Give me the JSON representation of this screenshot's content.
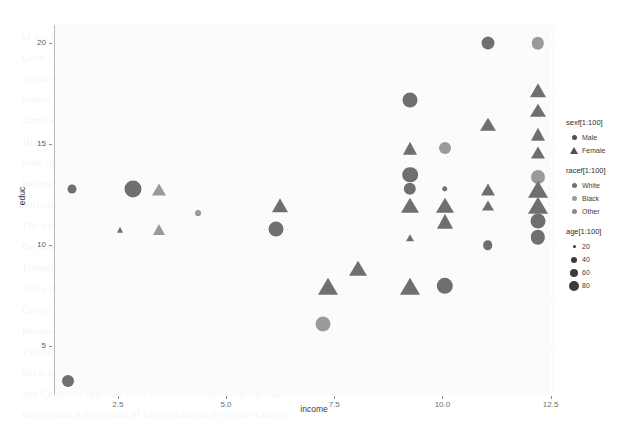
{
  "chart_data": {
    "type": "scatter",
    "title": "",
    "xlabel": "income",
    "ylabel": "educ",
    "xlim": [
      1.05,
      12.6
    ],
    "ylim": [
      2.6,
      20.9
    ],
    "xticks": [
      "2.5",
      "5.0",
      "7.5",
      "10.0",
      "12.5"
    ],
    "xtick_values": [
      2.5,
      5.0,
      7.5,
      10.0,
      12.5
    ],
    "yticks": [
      "5",
      "10",
      "15",
      "20"
    ],
    "ytick_values": [
      5,
      10,
      15,
      20
    ],
    "grid": true,
    "grid_color": "#ffffff",
    "panel_background": "#fbfbfb",
    "legend_position": "right",
    "encodings": {
      "shape": "sexf[1:100]",
      "color": "racef[1:100]",
      "size": "age[1:100]"
    },
    "shape_map": {
      "Male": "circle",
      "Female": "triangle"
    },
    "color_map": {
      "White": "#6f6f6f",
      "Black": "#9a9a9a",
      "Other": "#8a8a8a"
    },
    "size_map": {
      "20": 3,
      "40": 6,
      "60": 8,
      "80": 10
    },
    "points": [
      {
        "income": 1.35,
        "educ": 3.3,
        "sex": "Male",
        "race": "White",
        "age": 40
      },
      {
        "income": 1.45,
        "educ": 12.8,
        "sex": "Male",
        "race": "White",
        "age": 30
      },
      {
        "income": 2.85,
        "educ": 12.8,
        "sex": "Male",
        "race": "White",
        "age": 65
      },
      {
        "income": 2.55,
        "educ": 10.8,
        "sex": "Female",
        "race": "White",
        "age": 22
      },
      {
        "income": 3.45,
        "educ": 12.8,
        "sex": "Female",
        "race": "Black",
        "age": 45
      },
      {
        "income": 3.45,
        "educ": 10.8,
        "sex": "Female",
        "race": "Black",
        "age": 40
      },
      {
        "income": 4.35,
        "educ": 11.6,
        "sex": "Male",
        "race": "Black",
        "age": 18
      },
      {
        "income": 6.25,
        "educ": 12.0,
        "sex": "Female",
        "race": "White",
        "age": 52
      },
      {
        "income": 6.15,
        "educ": 10.8,
        "sex": "Male",
        "race": "White",
        "age": 55
      },
      {
        "income": 7.25,
        "educ": 6.1,
        "sex": "Male",
        "race": "Black",
        "age": 55
      },
      {
        "income": 7.35,
        "educ": 8.0,
        "sex": "Female",
        "race": "White",
        "age": 72
      },
      {
        "income": 8.05,
        "educ": 8.9,
        "sex": "Female",
        "race": "White",
        "age": 62
      },
      {
        "income": 9.25,
        "educ": 17.2,
        "sex": "Male",
        "race": "White",
        "age": 55
      },
      {
        "income": 9.25,
        "educ": 14.8,
        "sex": "Female",
        "race": "White",
        "age": 48
      },
      {
        "income": 9.25,
        "educ": 13.5,
        "sex": "Male",
        "race": "White",
        "age": 58
      },
      {
        "income": 9.25,
        "educ": 12.8,
        "sex": "Male",
        "race": "White",
        "age": 42
      },
      {
        "income": 9.25,
        "educ": 12.0,
        "sex": "Female",
        "race": "White",
        "age": 60
      },
      {
        "income": 9.25,
        "educ": 10.4,
        "sex": "Female",
        "race": "White",
        "age": 26
      },
      {
        "income": 9.25,
        "educ": 8.0,
        "sex": "Female",
        "race": "White",
        "age": 70
      },
      {
        "income": 10.05,
        "educ": 14.8,
        "sex": "Male",
        "race": "Black",
        "age": 40
      },
      {
        "income": 10.05,
        "educ": 12.8,
        "sex": "Male",
        "race": "White",
        "age": 15
      },
      {
        "income": 10.05,
        "educ": 12.0,
        "sex": "Female",
        "race": "White",
        "age": 62
      },
      {
        "income": 10.05,
        "educ": 11.2,
        "sex": "Female",
        "race": "White",
        "age": 58
      },
      {
        "income": 10.05,
        "educ": 8.0,
        "sex": "Male",
        "race": "White",
        "age": 62
      },
      {
        "income": 11.05,
        "educ": 20.0,
        "sex": "Male",
        "race": "White",
        "age": 45
      },
      {
        "income": 11.05,
        "educ": 16.0,
        "sex": "Female",
        "race": "White",
        "age": 50
      },
      {
        "income": 11.05,
        "educ": 12.8,
        "sex": "Female",
        "race": "White",
        "age": 46
      },
      {
        "income": 11.05,
        "educ": 12.0,
        "sex": "Female",
        "race": "White",
        "age": 35
      },
      {
        "income": 11.05,
        "educ": 10.0,
        "sex": "Male",
        "race": "White",
        "age": 32
      },
      {
        "income": 12.2,
        "educ": 20.0,
        "sex": "Male",
        "race": "Black",
        "age": 42
      },
      {
        "income": 12.2,
        "educ": 17.7,
        "sex": "Female",
        "race": "White",
        "age": 55
      },
      {
        "income": 12.2,
        "educ": 16.7,
        "sex": "Female",
        "race": "White",
        "age": 50
      },
      {
        "income": 12.2,
        "educ": 15.5,
        "sex": "Female",
        "race": "White",
        "age": 48
      },
      {
        "income": 12.2,
        "educ": 14.6,
        "sex": "Female",
        "race": "White",
        "age": 46
      },
      {
        "income": 12.2,
        "educ": 13.4,
        "sex": "Male",
        "race": "Black",
        "age": 50
      },
      {
        "income": 12.2,
        "educ": 12.8,
        "sex": "Female",
        "race": "White",
        "age": 70
      },
      {
        "income": 12.2,
        "educ": 12.0,
        "sex": "Female",
        "race": "White",
        "age": 68
      },
      {
        "income": 12.2,
        "educ": 11.2,
        "sex": "Male",
        "race": "White",
        "age": 55
      },
      {
        "income": 12.2,
        "educ": 10.4,
        "sex": "Male",
        "race": "White",
        "age": 52
      }
    ]
  },
  "axes": {
    "x_title": "income",
    "y_title": "educ",
    "x_ticks": [
      "2.5",
      "5.0",
      "7.5",
      "10.0",
      "12.5"
    ],
    "y_ticks": [
      "5",
      "10",
      "15",
      "20"
    ]
  },
  "legend": {
    "blocks": [
      {
        "title": "sexf[1:100]",
        "items": [
          {
            "label": "Male",
            "key": "circle"
          },
          {
            "label": "Female",
            "key": "triangle"
          }
        ]
      },
      {
        "title": "racef[1:100]",
        "items": [
          {
            "label": "White",
            "key": "circle"
          },
          {
            "label": "Black",
            "key": "circle"
          },
          {
            "label": "Other",
            "key": "circle"
          }
        ]
      },
      {
        "title": "age[1:100]",
        "items": [
          {
            "label": "20",
            "key": "circle"
          },
          {
            "label": "40",
            "key": "circle"
          },
          {
            "label": "60",
            "key": "circle"
          },
          {
            "label": "80",
            "key": "circle"
          }
        ]
      }
    ]
  },
  "background_text": {
    "lines": [
      "of the relationship between the variables in question and the",
      "Cook (2003) and Harrell (2015) both emphasize that graphical",
      "display conveys information that numerical summaries alone",
      "cannot. In the scatterplot below, four variables are mapped",
      "simultaneously onto position, shape, colour and size, which",
      "allows the reader to assess several marginal relations at once.",
      "Note that education is reported in completed years and that",
      "income has been log-transformed prior to plotting, so the",
      "horizontal scale is multiplicative rather than additive.",
      "The sample consists of 100 respondents drawn at random from",
      "the larger survey; missing values were deleted listwise.",
      "Triangles denote female respondents and circles male ones,",
      "while the area of each glyph is proportional to age in years.",
      "Colour encodes self-reported race, collapsed into three levels.",
      "Because several respondents report identical income values,",
      "a small amount of horizontal jitter would normally be added,",
      "but it has been suppressed here to preserve exact positions.",
      "See Chapter 7 (pp. 221-248) for the corresponding regression",
      "models and a discussion of heteroskedasticity in this sample.",
      "Readers interested in reproducing the figure will find the",
      "complete code listing in the online supplement, section B.4."
    ]
  }
}
